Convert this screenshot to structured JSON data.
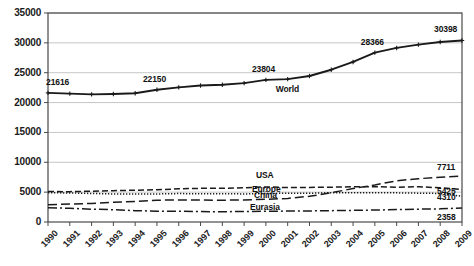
{
  "chart_data": {
    "type": "line",
    "title": "",
    "subtitle": "",
    "xlabel": "",
    "ylabel": "",
    "grid": true,
    "legend_position": "inline-labels",
    "xlim": [
      1990,
      2009
    ],
    "ylim": [
      0,
      35000
    ],
    "ytick_step": 5000,
    "categories": [
      1990,
      1991,
      1992,
      1993,
      1994,
      1995,
      1996,
      1997,
      1998,
      1999,
      2000,
      2001,
      2002,
      2003,
      2004,
      2005,
      2006,
      2007,
      2008,
      2009
    ],
    "x_tick_labels": [
      "1990",
      "1991",
      "1992",
      "1993",
      "1994",
      "1995",
      "1996",
      "1997",
      "1998",
      "1999",
      "2000",
      "2001",
      "2002",
      "2003",
      "2004",
      "2005",
      "2006",
      "2007",
      "2008",
      "2009"
    ],
    "y_tick_labels": [
      "0",
      "5000",
      "10000",
      "15000",
      "20000",
      "25000",
      "30000",
      "35000"
    ],
    "y_tick_values": [
      0,
      5000,
      10000,
      15000,
      20000,
      25000,
      30000,
      35000
    ],
    "series": [
      {
        "name": "World",
        "style": "solid",
        "color": "#1a1a1a",
        "markers": true,
        "label_text": "World",
        "values": [
          21616,
          21500,
          21380,
          21430,
          21560,
          22150,
          22550,
          22850,
          22980,
          23250,
          23804,
          23920,
          24450,
          25500,
          26800,
          28366,
          29150,
          29700,
          30150,
          30398
        ]
      },
      {
        "name": "USA",
        "style": "dashed",
        "color": "#1a1a1a",
        "markers": false,
        "label_text": "USA",
        "values": [
          5100,
          5080,
          5160,
          5250,
          5320,
          5400,
          5560,
          5640,
          5650,
          5720,
          5880,
          5760,
          5790,
          5830,
          5910,
          5920,
          5830,
          5900,
          5730,
          5425
        ]
      },
      {
        "name": "Europe",
        "style": "dotted",
        "color": "#1a1a1a",
        "markers": false,
        "label_text": "Europe",
        "values": [
          4900,
          4860,
          4780,
          4700,
          4680,
          4700,
          4760,
          4720,
          4740,
          4700,
          4760,
          4820,
          4820,
          4900,
          4900,
          4900,
          4880,
          4830,
          4780,
          4310
        ]
      },
      {
        "name": "China",
        "style": "longdash",
        "color": "#1a1a1a",
        "markers": false,
        "label_text": "China",
        "values": [
          2900,
          3000,
          3100,
          3300,
          3450,
          3650,
          3700,
          3680,
          3650,
          3700,
          3800,
          3950,
          4300,
          4900,
          5600,
          6200,
          6900,
          7250,
          7500,
          7711
        ]
      },
      {
        "name": "Eurasia",
        "style": "dashdot",
        "color": "#1a1a1a",
        "markers": false,
        "label_text": "Eurasia",
        "values": [
          2400,
          2300,
          2150,
          2050,
          1900,
          1820,
          1820,
          1750,
          1720,
          1760,
          1800,
          1830,
          1850,
          1900,
          1950,
          2000,
          2080,
          2150,
          2200,
          2358
        ]
      }
    ],
    "point_labels": [
      {
        "series": "World",
        "year": 1990,
        "text": "21616"
      },
      {
        "series": "World",
        "year": 1995,
        "text": "22150"
      },
      {
        "series": "World",
        "year": 2000,
        "text": "23804"
      },
      {
        "series": "World",
        "year": 2005,
        "text": "28366"
      },
      {
        "series": "World",
        "year": 2009,
        "text": "30398"
      }
    ],
    "end_labels": [
      {
        "series": "China",
        "text": "7711"
      },
      {
        "series": "USA",
        "text": "5425"
      },
      {
        "series": "Europe",
        "text": "4310"
      },
      {
        "series": "Eurasia",
        "text": "2358"
      }
    ]
  }
}
